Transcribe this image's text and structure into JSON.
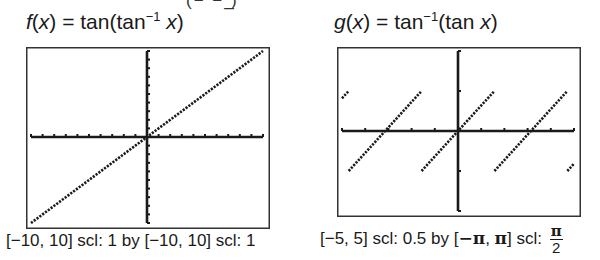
{
  "top_clipped_text": "(−  −  ̲)",
  "left_panel": {
    "title": {
      "lhs_fn": "f",
      "lhs_var": "x",
      "equals": " = ",
      "rhs_pre": "tan(tan",
      "rhs_sup": "−1",
      "rhs_var": " x",
      "rhs_post": ")"
    },
    "caption": "[−10, 10] scl: 1 by [−10, 10] scl: 1"
  },
  "right_panel": {
    "title": {
      "lhs_fn": "g",
      "lhs_var": "x",
      "equals": " = ",
      "rhs_pre": "tan",
      "rhs_sup": "−1",
      "rhs_mid": "(tan ",
      "rhs_var": "x",
      "rhs_post": ")"
    },
    "caption": {
      "part1": "[−5, 5] scl: 0.5 by [",
      "neg_pi": "−π",
      "comma": ", ",
      "pi": "π",
      "part2": "] scl: ",
      "frac_num": "π",
      "frac_den": "2"
    }
  },
  "colors": {
    "ink": "#1a1a1a",
    "frame": "#333333",
    "background": "#ffffff"
  },
  "chart_data": [
    {
      "type": "line",
      "title": "f(x) = tan(tan^-1 x)",
      "xlabel": "",
      "ylabel": "",
      "xlim": [
        -10,
        10
      ],
      "ylim": [
        -10,
        10
      ],
      "x_scale": 1,
      "y_scale": 1,
      "grid": false,
      "window_caption": "[-10, 10] scl: 1 by [-10, 10] scl: 1",
      "series": [
        {
          "name": "f(x)",
          "x": [
            -10,
            10
          ],
          "y": [
            -10,
            10
          ]
        }
      ]
    },
    {
      "type": "line",
      "title": "g(x) = tan^-1(tan x)",
      "xlabel": "",
      "ylabel": "",
      "xlim": [
        -5,
        5
      ],
      "ylim": [
        -3.1416,
        3.1416
      ],
      "x_scale": 0.5,
      "y_scale": 1.5708,
      "grid": false,
      "window_caption": "[-5, 5] scl: 0.5 by [-π, π] scl: π/2",
      "series": [
        {
          "name": "g(x) segment 1",
          "x": [
            -5,
            -4.7124
          ],
          "y": [
            1.2832,
            1.5708
          ]
        },
        {
          "name": "g(x) segment 2",
          "x": [
            -4.7124,
            -1.5708
          ],
          "y": [
            -1.5708,
            1.5708
          ]
        },
        {
          "name": "g(x) segment 3",
          "x": [
            -1.5708,
            1.5708
          ],
          "y": [
            -1.5708,
            1.5708
          ]
        },
        {
          "name": "g(x) segment 4",
          "x": [
            1.5708,
            4.7124
          ],
          "y": [
            -1.5708,
            1.5708
          ]
        },
        {
          "name": "g(x) segment 5",
          "x": [
            4.7124,
            5
          ],
          "y": [
            -1.5708,
            -1.2832
          ]
        }
      ]
    }
  ]
}
